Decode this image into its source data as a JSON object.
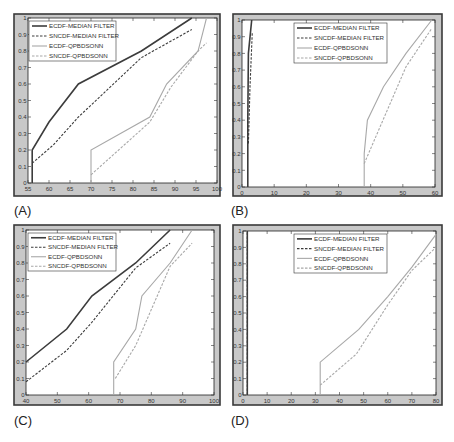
{
  "figure": {
    "panel_labels": [
      "(A)",
      "(B)",
      "(C)",
      "(D)"
    ]
  },
  "legend": {
    "entries": [
      "ECDF-MEDIAN FILTER",
      "SNCDF-MEDIAN FILTER",
      "ECDF-QPBDSONN",
      "SNCDF-QPBDSONN"
    ]
  },
  "colors": {
    "frame_bg": "#c8c8c8",
    "frame_border": "#3a3a3a",
    "plot_bg": "#ffffff",
    "median": "#3c3c3c",
    "qpbdsonn": "#a8a8a8"
  },
  "chart_data": [
    {
      "type": "line",
      "panel": "(A)",
      "title": "",
      "xlabel": "",
      "ylabel": "",
      "xlim": [
        55,
        100
      ],
      "ylim": [
        0,
        1
      ],
      "xticks": [
        55,
        60,
        65,
        70,
        75,
        80,
        85,
        90,
        95,
        100
      ],
      "xtick_labels": [
        "55",
        "60",
        "65",
        "70",
        "75",
        "80",
        "85",
        "90",
        "95",
        "100"
      ],
      "yticks": [
        0,
        0.1,
        0.2,
        0.3,
        0.4,
        0.5,
        0.6,
        0.7,
        0.8,
        0.9,
        1
      ],
      "ytick_labels": [
        "0",
        "0.1",
        "0.2",
        "0.3",
        "0.4",
        "0.5",
        "0.6",
        "0.7",
        "0.8",
        "0.9",
        "1"
      ],
      "grid": false,
      "legend_position": "upper left",
      "series": [
        {
          "name": "ECDF-MEDIAN FILTER",
          "style": "solid",
          "color": "median",
          "x": [
            56,
            56,
            60,
            67,
            82,
            94
          ],
          "y": [
            0,
            0.2,
            0.37,
            0.6,
            0.8,
            1.0
          ]
        },
        {
          "name": "SNCDF-MEDIAN FILTER",
          "style": "dashed",
          "color": "median",
          "x": [
            56,
            61,
            67,
            82,
            94
          ],
          "y": [
            0.12,
            0.23,
            0.4,
            0.76,
            0.93
          ]
        },
        {
          "name": "ECDF-QPBDSONN",
          "style": "solid",
          "color": "qpbdsonn",
          "x": [
            70,
            70,
            84,
            88,
            95.5,
            97,
            97.5
          ],
          "y": [
            0,
            0.2,
            0.4,
            0.6,
            0.8,
            0.95,
            1.0
          ]
        },
        {
          "name": "SNCDF-QPBDSONN",
          "style": "dashed",
          "color": "qpbdsonn",
          "x": [
            70,
            84,
            89,
            95.5,
            97.5
          ],
          "y": [
            0.05,
            0.37,
            0.58,
            0.8,
            0.85
          ]
        }
      ]
    },
    {
      "type": "line",
      "panel": "(B)",
      "title": "",
      "xlabel": "",
      "ylabel": "",
      "xlim": [
        0,
        60
      ],
      "ylim": [
        0,
        1
      ],
      "xticks": [
        0,
        10,
        20,
        30,
        40,
        50,
        60
      ],
      "xtick_labels": [
        "0",
        "10",
        "20",
        "30",
        "40",
        "50",
        "60"
      ],
      "yticks": [
        0,
        0.1,
        0.2,
        0.3,
        0.4,
        0.5,
        0.6,
        0.7,
        0.8,
        0.9,
        1
      ],
      "ytick_labels": [
        "0",
        "0.1",
        "0.2",
        "0.3",
        "0.4",
        "0.5",
        "0.6",
        "0.7",
        "0.8",
        "0.9",
        "1"
      ],
      "grid": false,
      "legend_position": "upper center",
      "series": [
        {
          "name": "ECDF-MEDIAN FILTER",
          "style": "solid",
          "color": "median",
          "x": [
            1.8,
            1.8,
            2.0,
            3.0
          ],
          "y": [
            0,
            0.4,
            0.8,
            1.0
          ]
        },
        {
          "name": "SNCDF-MEDIAN FILTER",
          "style": "dashed",
          "color": "median",
          "x": [
            2.0,
            2.5,
            3.2
          ],
          "y": [
            0.26,
            0.6,
            0.93
          ]
        },
        {
          "name": "ECDF-QPBDSONN",
          "style": "solid",
          "color": "qpbdsonn",
          "x": [
            38,
            38,
            39,
            44,
            51,
            59
          ],
          "y": [
            0,
            0.2,
            0.4,
            0.6,
            0.8,
            1.0
          ]
        },
        {
          "name": "SNCDF-QPBDSONN",
          "style": "dashed",
          "color": "qpbdsonn",
          "x": [
            38,
            51,
            59
          ],
          "y": [
            0.14,
            0.72,
            0.95
          ]
        }
      ]
    },
    {
      "type": "line",
      "panel": "(C)",
      "title": "",
      "xlabel": "",
      "ylabel": "",
      "xlim": [
        40,
        100
      ],
      "ylim": [
        0,
        1
      ],
      "xticks": [
        40,
        50,
        60,
        70,
        80,
        90,
        100
      ],
      "xtick_labels": [
        "40",
        "50",
        "60",
        "70",
        "80",
        "90",
        "100"
      ],
      "yticks": [
        0,
        0.1,
        0.2,
        0.3,
        0.4,
        0.5,
        0.6,
        0.7,
        0.8,
        0.9,
        1
      ],
      "ytick_labels": [
        "0",
        "0.1",
        "0.2",
        "0.3",
        "0.4",
        "0.5",
        "0.6",
        "0.7",
        "0.8",
        "0.9",
        "1"
      ],
      "grid": false,
      "legend_position": "upper left",
      "series": [
        {
          "name": "ECDF-MEDIAN FILTER",
          "style": "solid",
          "color": "median",
          "x": [
            40,
            53,
            61,
            75,
            86
          ],
          "y": [
            0.2,
            0.4,
            0.6,
            0.8,
            1.0
          ]
        },
        {
          "name": "SNCDF-MEDIAN FILTER",
          "style": "dashed",
          "color": "median",
          "x": [
            40,
            53,
            61,
            75,
            86
          ],
          "y": [
            0.08,
            0.27,
            0.44,
            0.77,
            0.92
          ]
        },
        {
          "name": "ECDF-QPBDSONN",
          "style": "solid",
          "color": "qpbdsonn",
          "x": [
            68,
            68,
            75,
            77,
            86,
            93
          ],
          "y": [
            0,
            0.2,
            0.4,
            0.6,
            0.8,
            1.0
          ]
        },
        {
          "name": "SNCDF-QPBDSONN",
          "style": "dashed",
          "color": "qpbdsonn",
          "x": [
            68.5,
            75,
            86,
            93
          ],
          "y": [
            0.1,
            0.3,
            0.78,
            0.92
          ]
        }
      ]
    },
    {
      "type": "line",
      "panel": "(D)",
      "title": "",
      "xlabel": "",
      "ylabel": "",
      "xlim": [
        0,
        80
      ],
      "ylim": [
        0,
        1
      ],
      "xticks": [
        0,
        10,
        20,
        30,
        40,
        50,
        60,
        70,
        80
      ],
      "xtick_labels": [
        "0",
        "10",
        "20",
        "30",
        "40",
        "50",
        "60",
        "70",
        "80"
      ],
      "yticks": [
        0,
        0.1,
        0.2,
        0.3,
        0.4,
        0.5,
        0.6,
        0.7,
        0.8,
        0.9,
        1
      ],
      "ytick_labels": [
        "0",
        "0.1",
        "0.2",
        "0.3",
        "0.4",
        "0.5",
        "0.6",
        "0.7",
        "0.8",
        "0.9",
        "1"
      ],
      "grid": false,
      "legend_position": "upper center",
      "series": [
        {
          "name": "ECDF-MEDIAN FILTER",
          "style": "solid",
          "color": "median",
          "x": [
            1.8,
            1.8
          ],
          "y": [
            0,
            1.0
          ]
        },
        {
          "name": "SNCDF-MEDIAN FILTER",
          "style": "dashed",
          "color": "median",
          "x": [
            1.8,
            1.8
          ],
          "y": [
            0,
            1.0
          ]
        },
        {
          "name": "ECDF-QPBDSONN",
          "style": "solid",
          "color": "qpbdsonn",
          "x": [
            32,
            32,
            48,
            60,
            70,
            80
          ],
          "y": [
            0,
            0.2,
            0.4,
            0.6,
            0.78,
            0.98
          ]
        },
        {
          "name": "SNCDF-QPBDSONN",
          "style": "dashed",
          "color": "qpbdsonn",
          "x": [
            32,
            47,
            60,
            70,
            80
          ],
          "y": [
            0.06,
            0.25,
            0.55,
            0.76,
            0.9
          ]
        }
      ]
    }
  ],
  "layout": {
    "panels": [
      {
        "frame": [
          14,
          14,
          206,
          182
        ],
        "plot": [
          28,
          18,
          217,
          183
        ],
        "legend": [
          29,
          21,
          116,
          61
        ],
        "label_pos": [
          14,
          203
        ]
      },
      {
        "frame": [
          233,
          14,
          209,
          182
        ],
        "plot": [
          242,
          20,
          435,
          187
        ],
        "legend": [
          294,
          23,
          387,
          63
        ],
        "label_pos": [
          231,
          203
        ]
      },
      {
        "frame": [
          14,
          225,
          206,
          180
        ],
        "plot": [
          26,
          230,
          214,
          395
        ],
        "legend": [
          28,
          233,
          116,
          271
        ],
        "label_pos": [
          14,
          413
        ]
      },
      {
        "frame": [
          233,
          225,
          209,
          180
        ],
        "plot": [
          243,
          231,
          436,
          395
        ],
        "legend": [
          294,
          234,
          387,
          273
        ],
        "label_pos": [
          231,
          413
        ]
      }
    ]
  }
}
